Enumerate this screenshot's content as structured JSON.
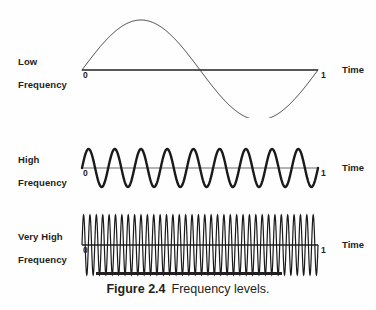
{
  "figure": {
    "caption_label": "Figure 2.4",
    "caption_text": "Frequency levels.",
    "background_color": "#fefefe",
    "ink_color": "#231f20"
  },
  "axis": {
    "start_tick": "0",
    "end_tick": "1",
    "name": "Time"
  },
  "panels": [
    {
      "id": "low-frequency",
      "label": "Low\nFrequency",
      "label_line1": "Low",
      "label_line2": "Frequency",
      "cycles": 1,
      "stroke_width": 1,
      "amplitude": 50,
      "baseline_y": 70,
      "axis_x_start": 82,
      "axis_x_end": 318
    },
    {
      "id": "high-frequency",
      "label": "High\nFrequency",
      "label_line1": "High",
      "label_line2": "Frequency",
      "cycles": 9,
      "stroke_width": 2.4,
      "amplitude": 19,
      "baseline_y": 168,
      "axis_x_start": 82,
      "axis_x_end": 318
    },
    {
      "id": "very-high-frequency",
      "label": "Very High\nFrequency",
      "label_line1": "Very High",
      "label_line2": "Frequency",
      "cycles": 37,
      "stroke_width": 1.2,
      "amplitude": 30,
      "baseline_y": 245,
      "axis_x_start": 82,
      "axis_x_end": 318
    }
  ],
  "chart_data": {
    "type": "line",
    "xlabel": "Time",
    "ylabel": "",
    "xlim": [
      0,
      1
    ],
    "grid": false,
    "legend": "none",
    "series": [
      {
        "name": "Low Frequency",
        "waveform": "sine",
        "cycles": 1,
        "amplitude": 1.0,
        "phase": 0
      },
      {
        "name": "High Frequency",
        "waveform": "sine",
        "cycles": 9,
        "amplitude": 1.0,
        "phase": 0
      },
      {
        "name": "Very High Frequency",
        "waveform": "sine",
        "cycles": 37,
        "amplitude": 1.0,
        "phase": 0
      }
    ],
    "xticks": [
      "0",
      "1"
    ]
  }
}
